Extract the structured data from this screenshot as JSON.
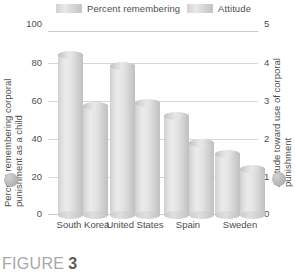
{
  "caption": {
    "word": "FIGURE",
    "number": "3"
  },
  "legend": {
    "position": "top",
    "items": [
      {
        "label": "Percent remembering",
        "swatch": "legend-swatch-percent"
      },
      {
        "label": "Attitude",
        "swatch": "legend-swatch-attitude"
      }
    ]
  },
  "axes": {
    "left_title": "Percent remembering corporal punishment as a child",
    "right_title": "Attitude toward use of corporal punishment",
    "left_ticks": [
      "100",
      "80",
      "60",
      "40",
      "20",
      "0"
    ],
    "right_ticks": [
      "5",
      "4",
      "3",
      "2",
      "1",
      "0"
    ],
    "left_dot": "left-axis-dot",
    "right_dot": "right-axis-dot"
  },
  "chart_data": {
    "type": "bar",
    "title": "",
    "subtitle": "",
    "xlabel": "",
    "ylabel": "Percent remembering corporal punishment as a child",
    "y2label": "Attitude toward use of corporal punishment",
    "categories": [
      "South Korea",
      "United States",
      "Spain",
      "Sweden"
    ],
    "series": [
      {
        "name": "Percent remembering",
        "axis": "left",
        "values": [
          87,
          81,
          54,
          33
        ]
      },
      {
        "name": "Attitude",
        "axis": "right",
        "values": [
          2.95,
          3.05,
          1.95,
          1.25
        ]
      }
    ],
    "ylim": [
      0,
      100
    ],
    "y2lim": [
      0,
      5
    ],
    "yticks": [
      0,
      20,
      40,
      60,
      80,
      100
    ],
    "y2ticks": [
      0,
      1,
      2,
      3,
      4,
      5
    ],
    "grid": true,
    "legend_position": "top",
    "bar_style": "cylinder",
    "colors": {
      "bar": "#dcdcdc",
      "grid": "#d6d6d6",
      "axis": "#c9c9c9",
      "text": "#4e4e4e"
    }
  }
}
